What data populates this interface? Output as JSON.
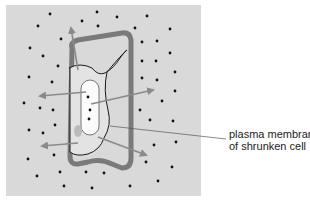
{
  "figure": {
    "background_color": "#d9d9d9",
    "cell_wall_color": "#7a7a7a",
    "membrane_color": "#1a1a1a",
    "arrow_color": "#8a8a8a",
    "vacuole_color": "#fbfbfb",
    "solute_dot_color": "#111111"
  },
  "labels": {
    "membrane_line1": "plasma membrane",
    "membrane_line2": "of shrunken cell"
  }
}
